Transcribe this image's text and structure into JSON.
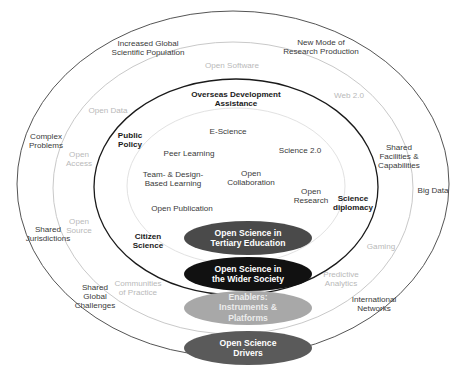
{
  "diagram": {
    "type": "concentric-ellipse-venn",
    "colors": {
      "ring_outer_stroke": "#555555",
      "ring_three_stroke": "#c9c9c9",
      "ring_two_stroke": "#1a1a1a",
      "ring_one_stroke": "#e2e2e2",
      "ellipse_tertiary_education": "#4a4a4a",
      "ellipse_wider_society": "#111111",
      "ellipse_enablers": "#a8a8a8",
      "ellipse_drivers": "#5a5a5a",
      "background": "#ffffff",
      "label_dark": "#1a1a1a",
      "label_grey": "#3a3a3a",
      "label_light": "#b9b9b9"
    }
  },
  "rings": {
    "outer": {
      "name": "Open Science Drivers ring",
      "labels": [
        "Increased Global\nScientific Population",
        "New Mode of\nResearch Production",
        "Complex\nProblems",
        "Shared\nFacilities &\nCapabilities",
        "Shared\nJurisdictions",
        "Big Data",
        "Shared\nGlobal\nChallenges",
        "International\nNetworks"
      ]
    },
    "three": {
      "name": "Enablers: Instruments & Platforms ring",
      "labels": [
        "Open Software",
        "Open Data",
        "Web 2.0",
        "Open\nAccess",
        "Open\nSource",
        "Communities\nof Practice",
        "Gaming",
        "Predictive\nAnalytics"
      ]
    },
    "two": {
      "name": "Open Science in the Wider Society ring",
      "labels": [
        "Overseas Development\nAssistance",
        "Public\nPolicy",
        "Citizen\nScience",
        "Science\ndiplomacy"
      ]
    },
    "one": {
      "name": "Open Science in Tertiary Education ring",
      "labels": [
        "E-Science",
        "Science 2.0",
        "Peer Learning",
        "Open\nCollaboration",
        "Team- & Design-\nBased Learning",
        "Open\nResearch",
        "Open Publication"
      ]
    }
  },
  "legend": {
    "items": [
      {
        "label": "Open Science in\nTertiary Education",
        "color": "#4a4a4a"
      },
      {
        "label": "Open Science in\nthe Wider Society",
        "color": "#111111"
      },
      {
        "label": "Enablers:\nInstruments &\nPlatforms",
        "color": "#a8a8a8"
      },
      {
        "label": "Open Science\nDrivers",
        "color": "#5a5a5a"
      }
    ]
  }
}
